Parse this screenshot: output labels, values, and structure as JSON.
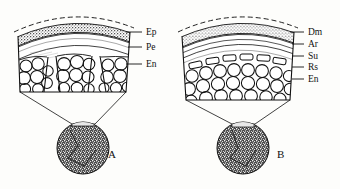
{
  "figure": {
    "background_color": "#fdfdfb",
    "ink_color": "#111111"
  },
  "panels": [
    {
      "id": "A",
      "caption": "A",
      "caption_pos": {
        "x": 108,
        "y": 158
      },
      "block": {
        "x": 18,
        "y": 14,
        "w": 112,
        "h": 78
      },
      "inset_circle": {
        "cx": 83,
        "cy": 148,
        "r": 26,
        "fill": "#2b2b2b"
      },
      "labels": [
        {
          "text": "Ep",
          "x": 146,
          "y": 35,
          "tick_x1": 126,
          "tick_x2": 142,
          "tick_y": 32
        },
        {
          "text": "Pe",
          "x": 146,
          "y": 50,
          "tick_x1": 128,
          "tick_x2": 142,
          "tick_y": 47
        },
        {
          "text": "En",
          "x": 146,
          "y": 67,
          "tick_x1": 126,
          "tick_x2": 142,
          "tick_y": 64
        }
      ]
    },
    {
      "id": "B",
      "caption": "B",
      "caption_pos": {
        "x": 277,
        "y": 158
      },
      "block": {
        "x": 182,
        "y": 14,
        "w": 112,
        "h": 86
      },
      "inset_circle": {
        "cx": 243,
        "cy": 148,
        "r": 26,
        "fill": "#2b2b2b"
      },
      "labels": [
        {
          "text": "Dm",
          "x": 308,
          "y": 35,
          "tick_x1": 290,
          "tick_x2": 304,
          "tick_y": 32
        },
        {
          "text": "Ar",
          "x": 308,
          "y": 47,
          "tick_x1": 292,
          "tick_x2": 304,
          "tick_y": 44
        },
        {
          "text": "Su",
          "x": 308,
          "y": 59,
          "tick_x1": 292,
          "tick_x2": 304,
          "tick_y": 56
        },
        {
          "text": "Rs",
          "x": 308,
          "y": 70,
          "tick_x1": 292,
          "tick_x2": 304,
          "tick_y": 67
        },
        {
          "text": "En",
          "x": 308,
          "y": 82,
          "tick_x1": 292,
          "tick_x2": 304,
          "tick_y": 79
        }
      ]
    }
  ],
  "legend_keys": {
    "Ep": "epidermis",
    "Pe": "pericycle",
    "En": "endodermis",
    "Dm": "dermal-layer",
    "Ar": "aerenchyma",
    "Su": "suberized-layer",
    "Rs": "resin-cells"
  }
}
